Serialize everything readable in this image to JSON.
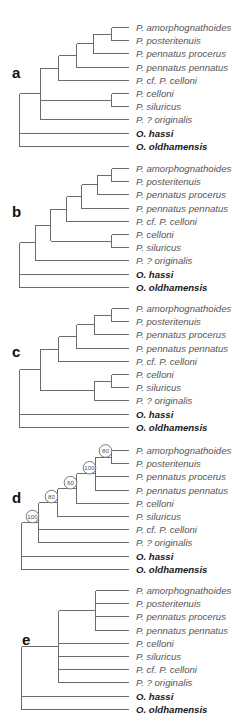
{
  "figure": {
    "leaf_end_x": 129,
    "label_x": 136,
    "leaf_spacing": 13.2,
    "colors": {
      "branch": "#6b6b6b",
      "ingroup_label": "#555555",
      "outgroup_label": "#1a1a1a"
    }
  },
  "chart_data": {
    "type": "phylogenetic-tree-panels",
    "panels": [
      {
        "letter": "a",
        "letter_pos": [
          12,
          78
        ],
        "top": 27,
        "leaves": [
          "P. amorphognathoides",
          "P. posteritenuis",
          "P. pennatus procerus",
          "P. pennatus pennatus",
          "P. cf. P. celloni",
          "P. celloni",
          "P. siluricus",
          "P. ? originalis",
          "O. hassi",
          "O. oldhamensis"
        ],
        "outgroup": [
          8,
          9
        ],
        "nodes": [
          {
            "x": 111,
            "children": [
              "L0",
              "L1"
            ]
          },
          {
            "x": 93,
            "children": [
              "N0",
              "L2"
            ]
          },
          {
            "x": 76,
            "children": [
              "N1",
              "L3"
            ]
          },
          {
            "x": 58,
            "children": [
              "N2",
              "L4"
            ]
          },
          {
            "x": 111,
            "children": [
              "L5",
              "L6"
            ]
          },
          {
            "x": 40,
            "children": [
              "N3",
              "N4",
              "L7"
            ]
          },
          {
            "x": 19,
            "children": [
              "N5",
              "L8",
              "L9"
            ]
          }
        ]
      },
      {
        "letter": "b",
        "letter_pos": [
          12,
          217
        ],
        "top": 168,
        "leaves": [
          "P. amorphognathoides",
          "P. posteritenuis",
          "P. pennatus procerus",
          "P. pennatus pennatus",
          "P. cf. P. celloni",
          "P. celloni",
          "P. siluricus",
          "P. ? originalis",
          "O. hassi",
          "O. oldhamensis"
        ],
        "outgroup": [
          8,
          9
        ],
        "nodes": [
          {
            "x": 111,
            "children": [
              "L0",
              "L1"
            ]
          },
          {
            "x": 97,
            "children": [
              "N0",
              "L2"
            ]
          },
          {
            "x": 81,
            "children": [
              "N1",
              "L3"
            ]
          },
          {
            "x": 66,
            "children": [
              "N2",
              "L4"
            ]
          },
          {
            "x": 111,
            "children": [
              "L5",
              "L6"
            ]
          },
          {
            "x": 50,
            "children": [
              "N3",
              "N4"
            ]
          },
          {
            "x": 35,
            "children": [
              "N5",
              "L7"
            ]
          },
          {
            "x": 19,
            "children": [
              "N6",
              "L8",
              "L9"
            ]
          }
        ]
      },
      {
        "letter": "c",
        "letter_pos": [
          12,
          357
        ],
        "top": 308,
        "leaves": [
          "P. amorphognathoides",
          "P. posteritenuis",
          "P. pennatus procerus",
          "P. pennatus pennatus",
          "P. cf. P. celloni",
          "P. celloni",
          "P. siluricus",
          "P. ? originalis",
          "O. hassi",
          "O. oldhamensis"
        ],
        "outgroup": [
          8,
          9
        ],
        "nodes": [
          {
            "x": 111,
            "children": [
              "L0",
              "L1"
            ]
          },
          {
            "x": 94,
            "children": [
              "N0",
              "L2"
            ]
          },
          {
            "x": 76,
            "children": [
              "N1",
              "L3"
            ]
          },
          {
            "x": 58,
            "children": [
              "N2",
              "L4"
            ]
          },
          {
            "x": 111,
            "children": [
              "L5",
              "L6"
            ]
          },
          {
            "x": 94,
            "children": [
              "N4",
              "L7"
            ]
          },
          {
            "x": 40,
            "children": [
              "N3",
              "N5"
            ]
          },
          {
            "x": 19,
            "children": [
              "N6",
              "L8",
              "L9"
            ]
          }
        ]
      },
      {
        "letter": "d",
        "letter_pos": [
          12,
          503
        ],
        "top": 450,
        "leaves": [
          "P. amorphognathoides",
          "P. posteritenuis",
          "P. pennatus procerus",
          "P. pennatus pennatus",
          "P. celloni",
          "P. siluricus",
          "P. cf. P. celloni",
          "P. ? originalis",
          "O. hassi",
          "O. oldhamensis"
        ],
        "outgroup": [
          8,
          9
        ],
        "nodes": [
          {
            "x": 111,
            "children": [
              "L0",
              "L1"
            ],
            "support": "80"
          },
          {
            "x": 95,
            "children": [
              "N0",
              "L2",
              "L3"
            ],
            "support": "100"
          },
          {
            "x": 76,
            "children": [
              "N1",
              "L4"
            ],
            "support": "60"
          },
          {
            "x": 57,
            "children": [
              "N2",
              "L5"
            ],
            "support": "80"
          },
          {
            "x": 38,
            "children": [
              "N3",
              "L6",
              "L7"
            ],
            "support": "100"
          },
          {
            "x": 21,
            "children": [
              "N4",
              "L8",
              "L9"
            ]
          }
        ]
      },
      {
        "letter": "e",
        "letter_pos": [
          22,
          645
        ],
        "top": 590,
        "leaves": [
          "P. amorphognathoides",
          "P. posteritenuis",
          "P. pennatus procerus",
          "P. pennatus pennatus",
          "P. celloni",
          "P. siluricus",
          "P. cf. P. celloni",
          "P. ? originalis",
          "O. hassi",
          "O. oldhamensis"
        ],
        "outgroup": [
          8,
          9
        ],
        "nodes": [
          {
            "x": 95,
            "children": [
              "L0",
              "L1",
              "L2",
              "L3"
            ]
          },
          {
            "x": 58,
            "children": [
              "N0",
              "L4",
              "L5",
              "L6",
              "L7"
            ]
          },
          {
            "x": 21,
            "children": [
              "N1",
              "L8",
              "L9"
            ]
          }
        ]
      }
    ]
  }
}
